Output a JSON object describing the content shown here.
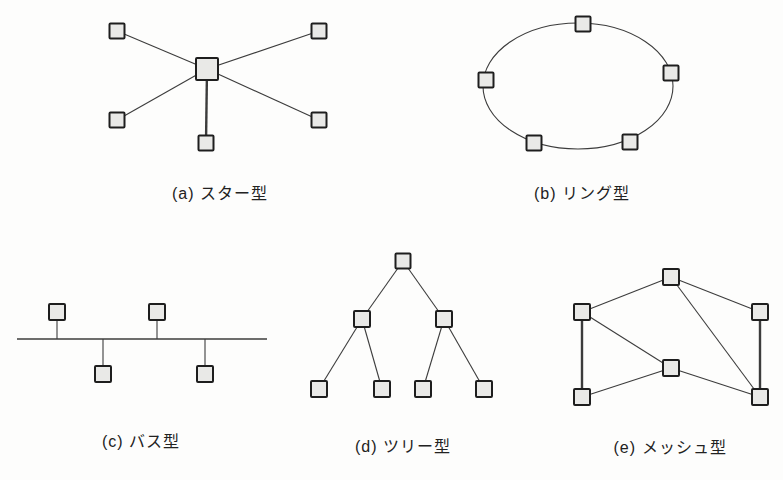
{
  "figure": {
    "background": "#fdfdfc"
  },
  "style": {
    "node_fill": "#e9e9e7",
    "node_stroke": "#1e1e1e",
    "node_stroke_width": 2,
    "edge_color": "#3c3c3c",
    "edge_width": 1.1,
    "thick_edge_width": 2.4,
    "label_color": "#222222"
  },
  "diagrams": [
    {
      "id": "star",
      "label": "(a) スター型",
      "label_pos": {
        "x": 220,
        "y": 180
      },
      "nodes": [
        {
          "id": "hub",
          "x": 207,
          "y": 69,
          "size": 22
        },
        {
          "id": "s1",
          "x": 117,
          "y": 31,
          "size": 15
        },
        {
          "id": "s2",
          "x": 319,
          "y": 31,
          "size": 15
        },
        {
          "id": "s3",
          "x": 117,
          "y": 120,
          "size": 15
        },
        {
          "id": "s4",
          "x": 319,
          "y": 120,
          "size": 15
        },
        {
          "id": "s5",
          "x": 206,
          "y": 143,
          "size": 15
        }
      ],
      "edges": [
        {
          "from": "hub",
          "to": "s1"
        },
        {
          "from": "hub",
          "to": "s2"
        },
        {
          "from": "hub",
          "to": "s3"
        },
        {
          "from": "hub",
          "to": "s4"
        },
        {
          "from": "hub",
          "to": "s5",
          "thick": true
        }
      ]
    },
    {
      "id": "ring",
      "label": "(b) リング型",
      "label_pos": {
        "x": 582,
        "y": 180
      },
      "ellipse": {
        "cx": 578,
        "cy": 86,
        "rx": 95,
        "ry": 63
      },
      "nodes": [
        {
          "id": "r1",
          "x": 583,
          "y": 24,
          "size": 15
        },
        {
          "id": "r2",
          "x": 671,
          "y": 73,
          "size": 15
        },
        {
          "id": "r3",
          "x": 486,
          "y": 80,
          "size": 15
        },
        {
          "id": "r4",
          "x": 534,
          "y": 143,
          "size": 15
        },
        {
          "id": "r5",
          "x": 630,
          "y": 142,
          "size": 15
        }
      ],
      "edges": []
    },
    {
      "id": "bus",
      "label": "(c) バス型",
      "label_pos": {
        "x": 141,
        "y": 428
      },
      "bus_line": {
        "x1": 17,
        "x2": 267,
        "y": 339
      },
      "nodes": [
        {
          "id": "b1",
          "x": 57,
          "y": 312,
          "size": 16
        },
        {
          "id": "b2",
          "x": 157,
          "y": 312,
          "size": 16
        },
        {
          "id": "b3",
          "x": 103,
          "y": 374,
          "size": 16
        },
        {
          "id": "b4",
          "x": 205,
          "y": 374,
          "size": 16
        }
      ],
      "edges": []
    },
    {
      "id": "tree",
      "label": "(d) ツリー型",
      "label_pos": {
        "x": 403,
        "y": 433
      },
      "nodes": [
        {
          "id": "root",
          "x": 403,
          "y": 261,
          "size": 15
        },
        {
          "id": "c1",
          "x": 362,
          "y": 319,
          "size": 16
        },
        {
          "id": "c2",
          "x": 444,
          "y": 319,
          "size": 16
        },
        {
          "id": "l1",
          "x": 319,
          "y": 389,
          "size": 16
        },
        {
          "id": "l2",
          "x": 382,
          "y": 389,
          "size": 16
        },
        {
          "id": "l3",
          "x": 423,
          "y": 389,
          "size": 16
        },
        {
          "id": "l4",
          "x": 484,
          "y": 389,
          "size": 16
        }
      ],
      "edges": [
        {
          "from": "root",
          "to": "c1"
        },
        {
          "from": "root",
          "to": "c2"
        },
        {
          "from": "c1",
          "to": "l1"
        },
        {
          "from": "c1",
          "to": "l2"
        },
        {
          "from": "c2",
          "to": "l3"
        },
        {
          "from": "c2",
          "to": "l4"
        }
      ]
    },
    {
      "id": "mesh",
      "label": "(e) メッシュ型",
      "label_pos": {
        "x": 670,
        "y": 434
      },
      "nodes": [
        {
          "id": "top",
          "x": 671,
          "y": 277,
          "size": 16
        },
        {
          "id": "left",
          "x": 582,
          "y": 312,
          "size": 16
        },
        {
          "id": "right",
          "x": 760,
          "y": 312,
          "size": 16
        },
        {
          "id": "mid",
          "x": 671,
          "y": 368,
          "size": 16
        },
        {
          "id": "bl",
          "x": 582,
          "y": 397,
          "size": 16
        },
        {
          "id": "br",
          "x": 760,
          "y": 397,
          "size": 16
        }
      ],
      "edges": [
        {
          "from": "top",
          "to": "left"
        },
        {
          "from": "top",
          "to": "right"
        },
        {
          "from": "top",
          "to": "br"
        },
        {
          "from": "left",
          "to": "mid"
        },
        {
          "from": "left",
          "to": "bl",
          "thick": true
        },
        {
          "from": "mid",
          "to": "bl"
        },
        {
          "from": "mid",
          "to": "br"
        },
        {
          "from": "right",
          "to": "br",
          "thick": true
        }
      ]
    }
  ]
}
